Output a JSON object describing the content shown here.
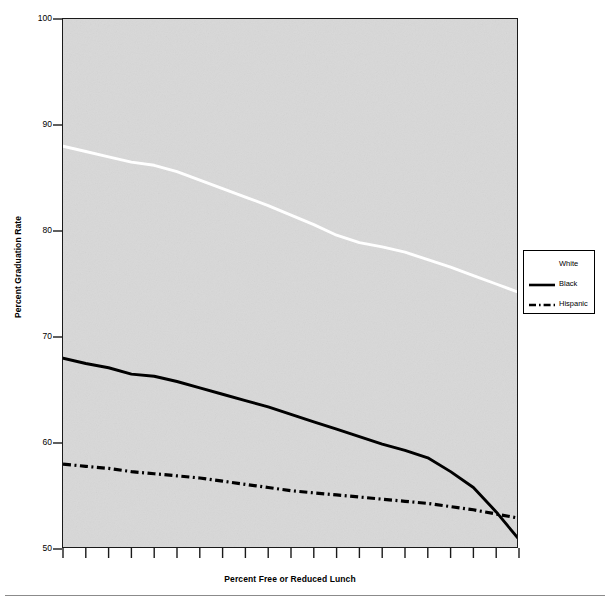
{
  "figure": {
    "background_color": "#ffffff",
    "plot_background_color": "#d8d8d8",
    "frame_color": "#1a1a1a"
  },
  "chart_data": {
    "type": "line",
    "title": "",
    "xlabel": "Percent Free or Reduced Lunch",
    "ylabel": "Percent Graduation Rate",
    "ylim": [
      50,
      100
    ],
    "yticks": [
      50,
      60,
      70,
      80,
      90,
      100
    ],
    "ytick_labels": [
      "50",
      "60",
      "70",
      "80",
      "90",
      "100"
    ],
    "xlim": [
      0,
      100
    ],
    "xticks": [
      0,
      5,
      10,
      15,
      20,
      25,
      30,
      35,
      40,
      45,
      50,
      55,
      60,
      65,
      70,
      75,
      80,
      85,
      90,
      95,
      100
    ],
    "xtick_labels": [],
    "grid": false,
    "legend_position": "right",
    "x": [
      0,
      5,
      10,
      15,
      20,
      25,
      30,
      35,
      40,
      45,
      50,
      55,
      60,
      65,
      70,
      75,
      80,
      85,
      90,
      95,
      100
    ],
    "series": [
      {
        "name": "White",
        "color": "#ffffff",
        "style": "solid",
        "values": [
          88.0,
          87.5,
          87.0,
          86.5,
          86.2,
          85.6,
          84.8,
          84.0,
          83.2,
          82.4,
          81.5,
          80.6,
          79.6,
          78.9,
          78.5,
          78.0,
          77.3,
          76.6,
          75.8,
          75.0,
          74.2
        ]
      },
      {
        "name": "Black",
        "color": "#000000",
        "style": "solid",
        "values": [
          68.0,
          67.5,
          67.1,
          66.5,
          66.3,
          65.8,
          65.2,
          64.6,
          64.0,
          63.4,
          62.7,
          62.0,
          61.3,
          60.6,
          59.9,
          59.3,
          58.6,
          57.3,
          55.8,
          53.5,
          50.9
        ]
      },
      {
        "name": "Hispanic",
        "color": "#000000",
        "style": "dashdot",
        "values": [
          58.0,
          57.8,
          57.6,
          57.3,
          57.1,
          56.9,
          56.7,
          56.4,
          56.1,
          55.8,
          55.5,
          55.3,
          55.1,
          54.9,
          54.7,
          54.5,
          54.3,
          54.0,
          53.7,
          53.3,
          52.9
        ]
      }
    ]
  },
  "legend": {
    "entries": [
      {
        "label": "White",
        "swatch": "white-line-swatch"
      },
      {
        "label": "Black",
        "swatch": "black-solid-line-swatch"
      },
      {
        "label": "Hispanic",
        "swatch": "black-dashdot-line-swatch"
      }
    ]
  }
}
